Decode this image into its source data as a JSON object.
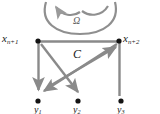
{
  "figure": {
    "width": 160,
    "height": 114,
    "background_color": "#ffffff",
    "line_color": "#8a8a8a",
    "node_color": "#141414",
    "label_color": "#1a1a1a",
    "omega_arc_color": "#8f8f8f"
  },
  "labels": {
    "top_left_vertex": "x",
    "top_left_vertex_sub": "n+1",
    "top_right_vertex": "x",
    "top_right_vertex_sub": "n+2",
    "region": "C",
    "omega": "Ω",
    "bottom_left_vertex": "y",
    "bottom_left_vertex_sub": "1",
    "bottom_middle_vertex": "y",
    "bottom_middle_vertex_sub": "2",
    "bottom_right_vertex": "y",
    "bottom_right_vertex_sub": "3"
  },
  "nodes": [
    {
      "name": "x-n-plus-1",
      "x": 38,
      "y": 41
    },
    {
      "name": "x-n-plus-2",
      "x": 119,
      "y": 41
    },
    {
      "name": "y-1",
      "x": 38,
      "y": 101
    },
    {
      "name": "y-2",
      "x": 78,
      "y": 101
    },
    {
      "name": "y-3",
      "x": 121,
      "y": 101
    }
  ],
  "edges": [
    {
      "name": "top-edge",
      "from": "x-n-plus-1",
      "to": "x-n-plus-2",
      "arrow": false
    },
    {
      "name": "right-edge",
      "from": "x-n-plus-2",
      "to": "y-3",
      "arrow": false
    },
    {
      "name": "left-arrow-down",
      "from": "x-n-plus-1",
      "to": "y-1",
      "arrow": true
    },
    {
      "name": "diagonal-to-lower-left",
      "from": "x-n-plus-2",
      "to": "y-1-region",
      "arrow": true
    },
    {
      "name": "diagonal-to-upper-right",
      "from": "y-2-region",
      "to": "x-n-plus-2",
      "arrow": true
    },
    {
      "name": "diagonal-to-lower-middle",
      "from": "x-n-plus-1",
      "to": "y-2",
      "arrow": true
    }
  ],
  "omega_arcs": [
    {
      "name": "omega-left-arc",
      "arrow": true
    },
    {
      "name": "omega-right-arc",
      "arrow": false
    },
    {
      "name": "omega-outer-arc",
      "arrow": false
    }
  ]
}
